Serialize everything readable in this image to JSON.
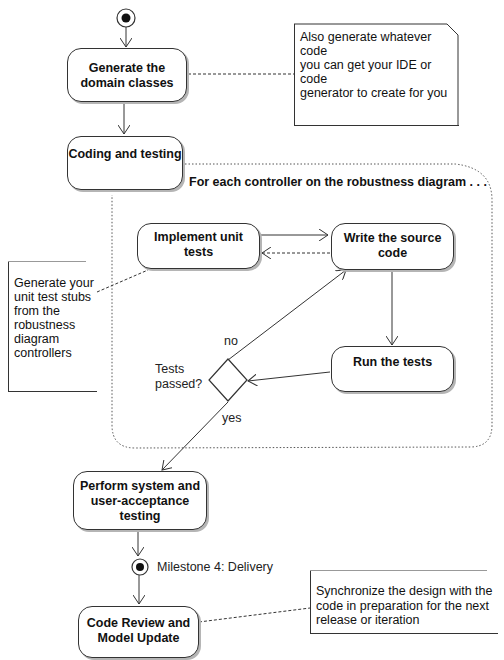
{
  "diagram": {
    "type": "activity",
    "start_node": {
      "label": ""
    },
    "activities": [
      {
        "id": "generate",
        "label": "Generate the domain classes"
      },
      {
        "id": "coding",
        "label": "Coding and testing"
      },
      {
        "id": "impl_tests",
        "label": "Implement unit tests"
      },
      {
        "id": "write_src",
        "label": "Write the source code"
      },
      {
        "id": "run_tests",
        "label": "Run the tests"
      },
      {
        "id": "perform",
        "label": "Perform system and user-acceptance testing"
      },
      {
        "id": "review",
        "label": "Code Review and Model Update"
      }
    ],
    "loop_region": {
      "label": "For each controller on the robustness diagram . . ."
    },
    "decision": {
      "label": "Tests passed?",
      "no_label": "no",
      "yes_label": "yes"
    },
    "milestone": {
      "label": "Milestone 4: Delivery"
    },
    "notes": [
      {
        "id": "note1",
        "text": "Also generate whatever code you can get your IDE or code generator to create for you"
      },
      {
        "id": "note2",
        "text": "Generate your unit test stubs from the robustness diagram controllers"
      },
      {
        "id": "note3",
        "text": "Synchronize the design with the code in preparation for the next release or iteration"
      }
    ]
  },
  "labels": {
    "generate_l1": "Generate the",
    "generate_l2": "domain classes",
    "coding": "Coding and testing",
    "loop": "For each controller on the robustness diagram . . .",
    "impl_tests": "Implement unit tests",
    "write_l1": "Write the source",
    "write_l2": "code",
    "run_tests": "Run the tests",
    "perform_l1": "Perform system and",
    "perform_l2": "user-acceptance",
    "perform_l3": "testing",
    "review_l1": "Code Review and",
    "review_l2": "Model Update",
    "tests_l1": "Tests",
    "tests_l2": "passed?",
    "no": "no",
    "yes": "yes",
    "milestone": "Milestone 4: Delivery",
    "note1_l1": "Also generate whatever code",
    "note1_l2": "you can get your IDE or code",
    "note1_l3": "generator to create for you",
    "note2_l1": "Generate your",
    "note2_l2": "unit test stubs",
    "note2_l3": "from the",
    "note2_l4": "robustness",
    "note2_l5": "diagram",
    "note2_l6": "controllers",
    "note3_l1": "Synchronize the design with the",
    "note3_l2": "code in preparation for the next",
    "note3_l3": "release or iteration"
  }
}
